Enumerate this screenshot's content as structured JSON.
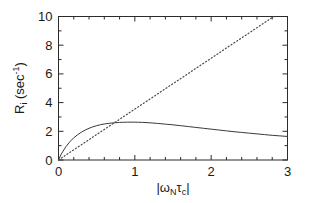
{
  "chart_data": {
    "type": "line",
    "title": "",
    "subtitle": "",
    "xlabel": "|ωNτc|",
    "xlabel_parts": {
      "bar_open": "|",
      "omega": "ω",
      "omega_sub": "N",
      "tau": "τ",
      "tau_sub": "c",
      "bar_close": "|"
    },
    "ylabel": "Ri (sec-1)",
    "ylabel_parts": {
      "R": "R",
      "R_sub": "i",
      "paren_open": " (",
      "sec": "sec",
      "exp": "-1",
      "paren_close": ")"
    },
    "xlim": [
      0,
      3
    ],
    "ylim": [
      0,
      10
    ],
    "x_major_ticks": [
      0,
      1,
      2,
      3
    ],
    "x_major_tick_labels": [
      "0",
      "1",
      "2",
      "3"
    ],
    "x_minor_step": 0.2,
    "y_major_ticks": [
      0,
      2,
      4,
      6,
      8,
      10
    ],
    "y_major_tick_labels": [
      "0",
      "2",
      "4",
      "6",
      "8",
      "10"
    ],
    "y_minor_step": 1,
    "grid": false,
    "legend": null,
    "frame": "box",
    "ticks_direction": "in",
    "series": [
      {
        "name": "solid-curve",
        "style": "solid",
        "color": "#3a3a3a",
        "x": [
          0.0,
          0.03,
          0.06,
          0.1,
          0.15,
          0.2,
          0.25,
          0.3,
          0.35,
          0.4,
          0.45,
          0.5,
          0.55,
          0.6,
          0.65,
          0.7,
          0.75,
          0.8,
          0.85,
          0.9,
          0.95,
          1.0,
          1.05,
          1.1,
          1.2,
          1.3,
          1.4,
          1.5,
          1.6,
          1.7,
          1.8,
          1.9,
          2.0,
          2.1,
          2.2,
          2.3,
          2.4,
          2.5,
          2.6,
          2.7,
          2.8,
          2.9,
          3.0
        ],
        "y": [
          0.0,
          0.35,
          0.62,
          0.95,
          1.28,
          1.55,
          1.76,
          1.94,
          2.09,
          2.21,
          2.31,
          2.39,
          2.46,
          2.51,
          2.55,
          2.58,
          2.6,
          2.62,
          2.63,
          2.635,
          2.64,
          2.635,
          2.63,
          2.62,
          2.59,
          2.55,
          2.5,
          2.45,
          2.39,
          2.33,
          2.27,
          2.21,
          2.15,
          2.09,
          2.03,
          1.97,
          1.92,
          1.87,
          1.82,
          1.77,
          1.72,
          1.68,
          1.64
        ]
      },
      {
        "name": "dotted-line",
        "style": "dotted",
        "color": "#4a4a4a",
        "x": [
          0.0,
          2.82
        ],
        "y": [
          0.0,
          10.0
        ]
      }
    ],
    "annotations": []
  }
}
